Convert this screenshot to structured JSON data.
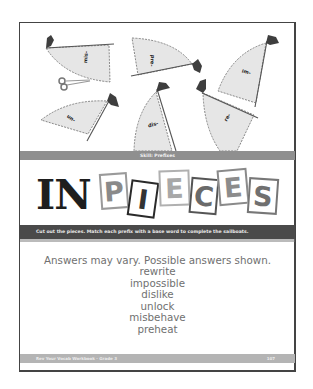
{
  "worksheet": {
    "skill_label": "Skill: Prefixes",
    "title": {
      "solid_part": "IN",
      "tiles": [
        {
          "letter": "P",
          "color": "#8a8a8a",
          "border": "#9a9a9a",
          "rotate": -4
        },
        {
          "letter": "I",
          "color": "#333333",
          "border": "#2a2a2a",
          "rotate": 8
        },
        {
          "letter": "E",
          "color": "#a8a8a8",
          "border": "#b0b0b0",
          "rotate": -2
        },
        {
          "letter": "C",
          "color": "#6a6a6a",
          "border": "#555555",
          "rotate": 5
        },
        {
          "letter": "E",
          "color": "#8c8c8c",
          "border": "#8a8a8a",
          "rotate": -5
        },
        {
          "letter": "S",
          "color": "#707070",
          "border": "#777777",
          "rotate": 4
        }
      ]
    },
    "instructions": "Cut out the pieces. Match each prefix with a base word to complete the sailboats.",
    "sail_pieces": [
      {
        "prefix": "mis-"
      },
      {
        "prefix": "pre-"
      },
      {
        "prefix": "im-"
      },
      {
        "prefix": "un-"
      },
      {
        "prefix": "dis-"
      },
      {
        "prefix": "re-"
      }
    ],
    "answers": {
      "lead": "Answers may vary. Possible answers shown.",
      "words": [
        "rewrite",
        "impossible",
        "dislike",
        "unlock",
        "misbehave",
        "preheat"
      ]
    },
    "footer": {
      "left": "Rev Your Vocab Workbook · Grade 3",
      "right": "107"
    }
  }
}
